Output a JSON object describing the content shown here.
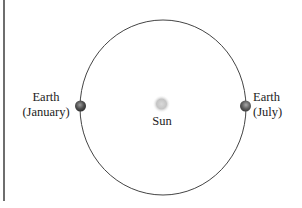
{
  "diagram": {
    "type": "orbit",
    "labels": {
      "earth_january_line1": "Earth",
      "earth_january_line2": "(January)",
      "earth_july_line1": "Earth",
      "earth_july_line2": "(July)",
      "sun": "Sun"
    },
    "colors": {
      "orbit": "#444444",
      "border": "#6e6e6e",
      "earth": "#555555",
      "sun": "#bdbdbd"
    }
  }
}
